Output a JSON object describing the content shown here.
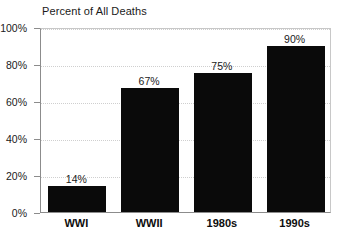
{
  "chart_data": {
    "type": "bar",
    "title": "Percent of All Deaths",
    "xlabel": "",
    "ylabel": "",
    "categories": [
      "WWI",
      "WWII",
      "1980s",
      "1990s"
    ],
    "values": [
      14,
      67,
      75,
      90
    ],
    "value_labels": [
      "14%",
      "67%",
      "75%",
      "90%"
    ],
    "ylim": [
      0,
      100
    ],
    "ytick_values": [
      0,
      20,
      40,
      60,
      80,
      100
    ],
    "ytick_labels": [
      "0%",
      "20%",
      "40%",
      "60%",
      "80%",
      "100%"
    ],
    "grid": true,
    "grid_axis": "y",
    "legend": false,
    "legend_position": "none",
    "bar_color": "#0a0a0a",
    "axis_color": "#8c8c8c",
    "gridline_color": "#cfcfcf",
    "background_color": "#ffffff",
    "text_color": "#1a1a1a"
  }
}
